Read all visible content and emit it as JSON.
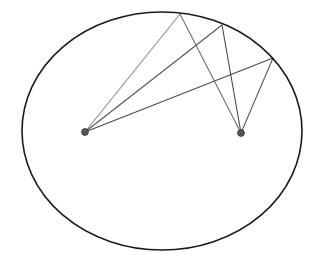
{
  "figure": {
    "type": "geometry-diagram",
    "width": 317,
    "height": 266,
    "background_color": "#ffffff"
  },
  "ellipse": {
    "name": "boundary-ellipse",
    "cx": 162,
    "cy": 131,
    "rx": 140,
    "ry": 119,
    "stroke_color": "#1a1a1a",
    "stroke_width": 1.6,
    "fill": "none"
  },
  "foci": [
    {
      "id": "left-focus",
      "label": "F1",
      "x": 85,
      "y": 132,
      "radius": 3.4,
      "fill_color": "#555555",
      "stroke_color": "#333333"
    },
    {
      "id": "right-focus",
      "label": "F2",
      "x": 241,
      "y": 133,
      "radius": 3.4,
      "fill_color": "#555555",
      "stroke_color": "#333333"
    }
  ],
  "boundary_points": [
    {
      "id": "vertex-a",
      "label": "A",
      "x": 180,
      "y": 14
    },
    {
      "id": "vertex-b",
      "label": "B",
      "x": 222,
      "y": 25
    },
    {
      "id": "vertex-c",
      "label": "C",
      "x": 273,
      "y": 58
    }
  ],
  "rays": [
    {
      "id": "ray-f1-a",
      "from": "left-focus",
      "to": "vertex-a",
      "x1": 85,
      "y1": 132,
      "x2": 180,
      "y2": 14,
      "stroke_color": "#8c8c8c",
      "stroke_width": 1.1
    },
    {
      "id": "ray-f1-b",
      "from": "left-focus",
      "to": "vertex-b",
      "x1": 85,
      "y1": 132,
      "x2": 222,
      "y2": 25,
      "stroke_color": "#555555",
      "stroke_width": 1.1
    },
    {
      "id": "ray-f1-c",
      "from": "left-focus",
      "to": "vertex-c",
      "x1": 85,
      "y1": 132,
      "x2": 273,
      "y2": 58,
      "stroke_color": "#4a4a4a",
      "stroke_width": 1.1
    },
    {
      "id": "ray-f2-a",
      "from": "right-focus",
      "to": "vertex-a",
      "x1": 241,
      "y1": 133,
      "x2": 180,
      "y2": 14,
      "stroke_color": "#6e6e6e",
      "stroke_width": 1.1
    },
    {
      "id": "ray-f2-b",
      "from": "right-focus",
      "to": "vertex-b",
      "x1": 241,
      "y1": 133,
      "x2": 222,
      "y2": 25,
      "stroke_color": "#4a4a4a",
      "stroke_width": 1.1
    },
    {
      "id": "ray-f2-c",
      "from": "right-focus",
      "to": "vertex-c",
      "x1": 241,
      "y1": 133,
      "x2": 273,
      "y2": 58,
      "stroke_color": "#5a5a5a",
      "stroke_width": 1.1
    }
  ]
}
